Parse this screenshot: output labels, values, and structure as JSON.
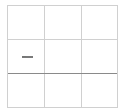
{
  "grid": {
    "rows": 3,
    "columns": 3,
    "cells": [
      {
        "row": 1,
        "col": 0,
        "label": "····"
      }
    ]
  }
}
